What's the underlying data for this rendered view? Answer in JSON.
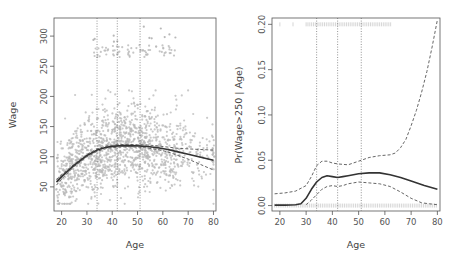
{
  "chart_data": [
    {
      "type": "scatter",
      "title": "",
      "xlabel": "Age",
      "ylabel": "Wage",
      "xlim": [
        17,
        81
      ],
      "ylim": [
        10,
        330
      ],
      "xticks": [
        20,
        30,
        40,
        50,
        60,
        70,
        80
      ],
      "yticks": [
        50,
        100,
        150,
        200,
        250,
        300
      ],
      "grid": false,
      "knots": [
        34,
        42,
        51
      ],
      "series": [
        {
          "name": "fit",
          "style": "solid",
          "x": [
            18,
            20,
            25,
            30,
            34,
            38,
            42,
            46,
            50,
            54,
            58,
            62,
            66,
            70,
            75,
            80
          ],
          "y": [
            58,
            67,
            86,
            102,
            111,
            116,
            118,
            118.5,
            118,
            117,
            115,
            112,
            108,
            104,
            99,
            94
          ]
        },
        {
          "name": "upper-95",
          "style": "dashed",
          "x": [
            18,
            20,
            25,
            30,
            34,
            38,
            42,
            46,
            50,
            54,
            58,
            62,
            66,
            70,
            75,
            80
          ],
          "y": [
            62,
            70,
            88,
            104,
            113,
            118,
            120,
            120.5,
            120,
            119.5,
            118,
            116,
            114,
            113,
            112,
            111
          ]
        },
        {
          "name": "lower-95",
          "style": "dashed",
          "x": [
            18,
            20,
            25,
            30,
            34,
            38,
            42,
            46,
            50,
            54,
            58,
            62,
            66,
            70,
            75,
            80
          ],
          "y": [
            53,
            63,
            84,
            100,
            109,
            114,
            116,
            116.5,
            116,
            114.5,
            112,
            108,
            102,
            96,
            87,
            78
          ]
        }
      ],
      "scatter_cloud": {
        "n_main": 1400,
        "n_high": 70,
        "color": "#b8b8b8",
        "high_band": [
          265,
          285
        ],
        "high_age": [
          30,
          65
        ]
      }
    },
    {
      "type": "line",
      "title": "",
      "xlabel": "Age",
      "ylabel": "Pr(Wage>250 | Age)",
      "xlim": [
        17,
        81
      ],
      "ylim": [
        -0.006,
        0.207
      ],
      "xticks": [
        20,
        30,
        40,
        50,
        60,
        70,
        80
      ],
      "yticks": [
        0.0,
        0.05,
        0.1,
        0.15,
        0.2
      ],
      "ytick_labels": [
        "0.00",
        "0.05",
        "0.10",
        "0.15",
        "0.20"
      ],
      "grid": false,
      "knots": [
        34,
        42,
        51
      ],
      "series": [
        {
          "name": "fit",
          "style": "solid",
          "x": [
            18,
            22,
            26,
            28,
            30,
            32,
            34,
            36,
            38,
            40,
            42,
            44,
            46,
            50,
            54,
            58,
            62,
            66,
            70,
            75,
            80
          ],
          "y": [
            0.0005,
            0.0005,
            0.001,
            0.002,
            0.008,
            0.018,
            0.026,
            0.031,
            0.033,
            0.032,
            0.031,
            0.032,
            0.033,
            0.035,
            0.036,
            0.036,
            0.034,
            0.031,
            0.027,
            0.022,
            0.018
          ]
        },
        {
          "name": "upper-95",
          "style": "dashed",
          "x": [
            18,
            22,
            26,
            30,
            32,
            34,
            36,
            38,
            40,
            42,
            46,
            50,
            54,
            58,
            62,
            64,
            66,
            68,
            70,
            72,
            74,
            76,
            78,
            80
          ],
          "y": [
            0.013,
            0.014,
            0.016,
            0.022,
            0.032,
            0.044,
            0.049,
            0.049,
            0.047,
            0.046,
            0.045,
            0.049,
            0.053,
            0.055,
            0.056,
            0.058,
            0.064,
            0.073,
            0.088,
            0.105,
            0.125,
            0.148,
            0.175,
            0.205
          ]
        },
        {
          "name": "lower-95",
          "style": "dashed",
          "x": [
            30,
            32,
            34,
            36,
            38,
            40,
            42,
            44,
            46,
            50,
            54,
            58,
            62,
            66,
            70,
            74,
            77,
            80
          ],
          "y": [
            0.001,
            0.006,
            0.012,
            0.018,
            0.021,
            0.022,
            0.021,
            0.022,
            0.024,
            0.026,
            0.025,
            0.024,
            0.021,
            0.015,
            0.008,
            0.003,
            0.002,
            0.001
          ]
        }
      ],
      "rug": {
        "top_y": 0.2,
        "top_age": [
          20,
          65
        ],
        "bottom_y": 0.0,
        "bottom_age": [
          18,
          80
        ],
        "color": "#bbbbbb"
      }
    }
  ],
  "panels": [
    {
      "xlabel": "Age",
      "ylabel": "Wage"
    },
    {
      "xlabel": "Age",
      "ylabel": "Pr(Wage>250 | Age)"
    }
  ]
}
